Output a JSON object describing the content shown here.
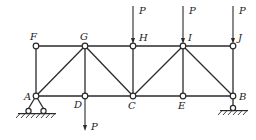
{
  "diagram": {
    "type": "truss",
    "nodes": [
      {
        "id": "F",
        "x": 36,
        "y": 46,
        "label": "F",
        "lx": 30,
        "ly": 40
      },
      {
        "id": "G",
        "x": 85,
        "y": 46,
        "label": "G",
        "lx": 80,
        "ly": 40
      },
      {
        "id": "H",
        "x": 133,
        "y": 46,
        "label": "H",
        "lx": 139,
        "ly": 41
      },
      {
        "id": "I",
        "x": 183,
        "y": 46,
        "label": "I",
        "lx": 188,
        "ly": 41
      },
      {
        "id": "J",
        "x": 233,
        "y": 46,
        "label": "J",
        "lx": 238,
        "ly": 41
      },
      {
        "id": "A",
        "x": 36,
        "y": 96,
        "label": "A",
        "lx": 24,
        "ly": 100
      },
      {
        "id": "D",
        "x": 85,
        "y": 96,
        "label": "D",
        "lx": 74,
        "ly": 108
      },
      {
        "id": "C",
        "x": 133,
        "y": 96,
        "label": "C",
        "lx": 128,
        "ly": 109
      },
      {
        "id": "E",
        "x": 183,
        "y": 96,
        "label": "E",
        "lx": 178,
        "ly": 109
      },
      {
        "id": "B",
        "x": 233,
        "y": 96,
        "label": "B",
        "lx": 239,
        "ly": 100
      }
    ],
    "members": [
      [
        "F",
        "G"
      ],
      [
        "G",
        "H"
      ],
      [
        "H",
        "I"
      ],
      [
        "I",
        "J"
      ],
      [
        "A",
        "D"
      ],
      [
        "D",
        "C"
      ],
      [
        "C",
        "E"
      ],
      [
        "E",
        "B"
      ],
      [
        "F",
        "A"
      ],
      [
        "G",
        "D"
      ],
      [
        "H",
        "C"
      ],
      [
        "I",
        "E"
      ],
      [
        "J",
        "B"
      ],
      [
        "A",
        "G"
      ],
      [
        "G",
        "C"
      ],
      [
        "C",
        "I"
      ],
      [
        "I",
        "B"
      ]
    ],
    "loads": [
      {
        "at": "H",
        "label": "P",
        "direction": "down",
        "x": 133,
        "y1": 6,
        "y2": 44,
        "lx": 139,
        "ly": 14
      },
      {
        "at": "I",
        "label": "P",
        "direction": "down",
        "x": 183,
        "y1": 6,
        "y2": 44,
        "lx": 189,
        "ly": 14
      },
      {
        "at": "J",
        "label": "P",
        "direction": "down",
        "x": 233,
        "y1": 6,
        "y2": 44,
        "lx": 239,
        "ly": 14
      },
      {
        "at": "D",
        "label": "P",
        "direction": "down",
        "x": 85,
        "y1": 98,
        "y2": 131,
        "lx": 91,
        "ly": 130
      }
    ],
    "supports": [
      {
        "at": "A",
        "type": "pin"
      },
      {
        "at": "B",
        "type": "roller"
      }
    ]
  }
}
